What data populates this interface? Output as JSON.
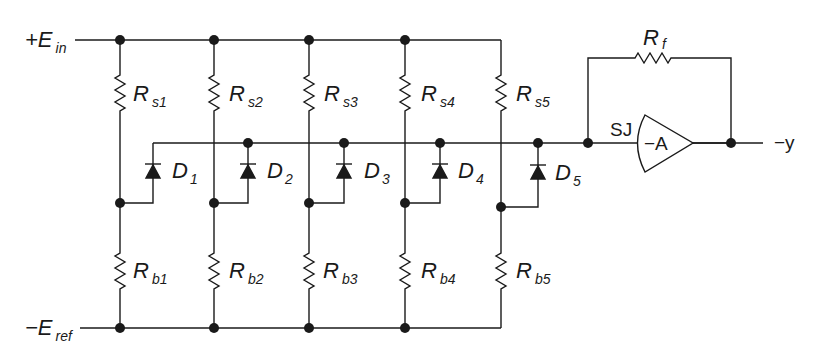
{
  "diagram": {
    "colors": {
      "ink": "#1a1a1a",
      "background": "#ffffff"
    },
    "inputs": {
      "top_rail": {
        "main": "+E",
        "sub": "in"
      },
      "bottom_rail": {
        "main": "−E",
        "sub": "ref"
      }
    },
    "branches": [
      {
        "rs": {
          "main": "R",
          "sub": "s1"
        },
        "rb": {
          "main": "R",
          "sub": "b1"
        },
        "diode": {
          "main": "D",
          "sub": "1"
        }
      },
      {
        "rs": {
          "main": "R",
          "sub": "s2"
        },
        "rb": {
          "main": "R",
          "sub": "b2"
        },
        "diode": {
          "main": "D",
          "sub": "2"
        }
      },
      {
        "rs": {
          "main": "R",
          "sub": "s3"
        },
        "rb": {
          "main": "R",
          "sub": "b3"
        },
        "diode": {
          "main": "D",
          "sub": "3"
        }
      },
      {
        "rs": {
          "main": "R",
          "sub": "s4"
        },
        "rb": {
          "main": "R",
          "sub": "b4"
        },
        "diode": {
          "main": "D",
          "sub": "4"
        }
      },
      {
        "rs": {
          "main": "R",
          "sub": "s5"
        },
        "rb": {
          "main": "R",
          "sub": "b5"
        },
        "diode": {
          "main": "D",
          "sub": "5"
        }
      }
    ],
    "amplifier": {
      "summing_junction": "SJ",
      "gain": "−A",
      "feedback": {
        "main": "R",
        "sub": "f"
      },
      "output": "−y"
    }
  }
}
